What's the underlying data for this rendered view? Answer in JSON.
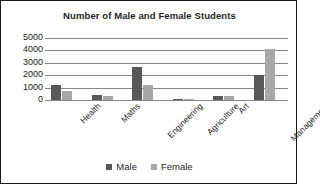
{
  "chart_data": {
    "type": "bar",
    "title": "Number of Male and Female Students",
    "xlabel": "",
    "ylabel": "",
    "ylim": [
      0,
      5000
    ],
    "ytick_labels": [
      "5000",
      "4000",
      "3000",
      "2000",
      "1000",
      "0"
    ],
    "yticks": [
      5000,
      4000,
      3000,
      2000,
      1000,
      0
    ],
    "grid": true,
    "legend_position": "bottom-center",
    "categories": [
      "Health",
      "Maths",
      "Engineering",
      "Agriculture",
      "Art",
      "Management"
    ],
    "series": [
      {
        "name": "Male",
        "color": "#585858",
        "values": [
          1200,
          400,
          2700,
          100,
          300,
          2050
        ]
      },
      {
        "name": "Female",
        "color": "#a8a8a8",
        "values": [
          700,
          300,
          1250,
          80,
          320,
          4100
        ]
      }
    ]
  },
  "legend": {
    "items": [
      {
        "label": "Male",
        "color": "#585858"
      },
      {
        "label": "Female",
        "color": "#a8a8a8"
      }
    ]
  },
  "style": {
    "border_color": "#1a1a1a",
    "gridline_color": "#868686",
    "background": "#ffffff",
    "text_color": "#1f1f1f"
  }
}
